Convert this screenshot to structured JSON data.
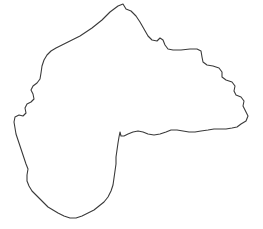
{
  "figure": {
    "type": "outline-map",
    "title": "",
    "caption": "",
    "canvas": {
      "width": 263,
      "height": 229
    },
    "background_color": "#ffffff"
  },
  "map": {
    "name": "region-outline",
    "description": "Single closed administrative boundary outline, no labels",
    "stroke_color": "#3a3a3a",
    "fill_color": "#ffffff",
    "stroke_width": 1.1,
    "features": [
      {
        "name": "northern-peak",
        "x": 123,
        "y": 4
      },
      {
        "name": "eastern-extremity",
        "x": 248,
        "y": 116
      },
      {
        "name": "western-extremity",
        "x": 14,
        "y": 120
      },
      {
        "name": "southern-extremity",
        "x": 80,
        "y": 219
      },
      {
        "name": "central-notch",
        "x": 120,
        "y": 136
      }
    ],
    "path": "M123,4 L126,9 L131,11 L136,16 L140,22 L144,29 L148,36 L152,40 L157,41 L160,38 L163,40 L165,45 L168,49 L173,50 L181,50 L190,49 L197,49 L201,51 L202,57 L203,62 L207,65 L213,66 L219,68 L222,72 L222,77 L226,80 L232,82 L235,86 L234,91 L236,95 L241,97 L244,101 L243,106 L245,110 L248,116 L246,121 L241,124 L237,127 L232,128 L226,129 L220,129 L214,129 L208,130 L201,131 L195,132 L189,132 L183,131 L177,130 L171,130 L166,132 L160,134 L154,135 L148,134 L143,132 L138,131 L133,132 L128,134 L124,136 L121,136 L120,132 L119,137 L118,143 L117,150 L116,157 L116,164 L115,171 L114,178 L113,185 L111,191 L108,197 L104,202 L99,206 L94,210 L88,213 L82,216 L76,218 L70,218 L64,216 L58,213 L53,210 L48,207 L44,203 L40,199 L36,195 L32,191 L29,186 L27,181 L27,175 L28,169 L26,164 L24,158 L22,152 L20,146 L18,140 L16,134 L15,128 L14,122 L15,117 L19,115 L23,116 L26,113 L25,108 L27,104 L31,102 L34,99 L33,94 L31,90 L33,86 L37,83 L40,79 L41,73 L42,66 L44,60 L47,55 L51,51 L56,48 L62,45 L68,42 L74,39 L80,36 L86,32 L92,28 L97,24 L102,20 L106,16 L110,12 L114,9 L118,6 Z"
  }
}
